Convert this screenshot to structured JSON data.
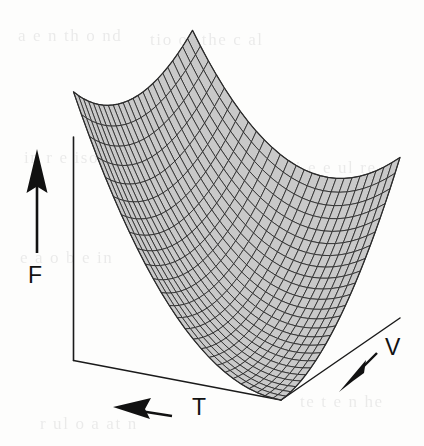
{
  "figure": {
    "kind": "3d-surface-plot",
    "caption_visible": false,
    "background_color": "#fdfdfc",
    "ink_color": "#111111",
    "surface_fill": "#c9c9c9",
    "mesh_line_color": "#2b2b2b"
  },
  "axes": {
    "vertical": {
      "id": "F",
      "label": "F",
      "arrow_direction": "up",
      "arrow_name": "f-axis-arrow"
    },
    "horizontal": {
      "id": "T",
      "label": "T",
      "arrow_direction": "left",
      "arrow_name": "t-axis-arrow"
    },
    "depth": {
      "id": "V",
      "label": "V",
      "arrow_direction": "down-left",
      "arrow_name": "v-axis-arrow"
    }
  },
  "chart_data": {
    "type": "surface",
    "title": "",
    "xlabel": "T",
    "ylabel": "V",
    "zlabel": "F",
    "grid": true,
    "legend": false,
    "axis_ticks": [],
    "x": [
      0,
      0.0833,
      0.1667,
      0.25,
      0.3333,
      0.4167,
      0.5,
      0.5833,
      0.6667,
      0.75,
      0.8333,
      0.9167,
      1
    ],
    "y": [
      0,
      0.0833,
      0.1667,
      0.25,
      0.3333,
      0.4167,
      0.5,
      0.5833,
      0.6667,
      0.75,
      0.8333,
      0.9167,
      1
    ],
    "xlim": [
      0,
      1
    ],
    "ylim": [
      0,
      1
    ],
    "zlim": [
      0,
      1
    ],
    "surface_formula": "F(T,V) = 0.92*(1-T)^2.1 + 0.55*V^1.9 - 0.62*(1-T)*V",
    "mesh_columns": 26,
    "mesh_rows": 24
  },
  "background_bleed": {
    "visible": true,
    "lines": [
      "a  e   n  th   o    nd",
      "tio    of   the   c   al",
      "in    r e  iso   ti  n  g",
      "w  h  gi   e  e  ul   re",
      "e   a    o    b e   in",
      "te  t   e     n  he",
      "r  ul  o   a  at    n"
    ]
  }
}
